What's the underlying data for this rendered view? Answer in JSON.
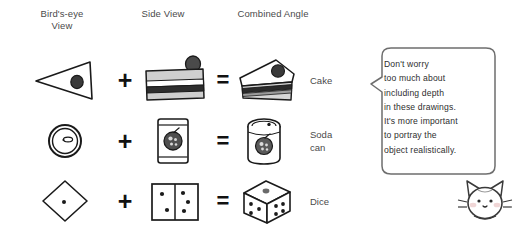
{
  "headers": {
    "birdseye": "Bird's-eye\nView",
    "side": "Side View",
    "combined": "Combined Angle"
  },
  "operators": {
    "plus": "+",
    "equals": "="
  },
  "rows": [
    {
      "id": "cake",
      "label": "Cake",
      "birdseye_icon": "cake-triangle-topview-icon",
      "side_icon": "cake-slab-sideview-icon",
      "combined_icon": "cake-wedge-3d-icon"
    },
    {
      "id": "soda",
      "label": "Soda\ncan",
      "birdseye_icon": "can-lid-topview-icon",
      "side_icon": "can-sideview-icon",
      "combined_icon": "can-3d-icon"
    },
    {
      "id": "dice",
      "label": "Dice",
      "birdseye_icon": "die-diamond-topview-icon",
      "side_icon": "die-two-faces-sideview-icon",
      "combined_icon": "die-cube-3d-icon"
    }
  ],
  "speech_bubble": {
    "text": "Don't worry\ntoo much about\nincluding depth\nin these drawings.\nIt's more important\nto portray the\nobject realistically.",
    "tail_direction": "left"
  },
  "mascot": {
    "icon": "cat-face-icon"
  },
  "colors": {
    "background": "#ffffff",
    "text": "#3b3b3b",
    "ink": "#1a1a1a",
    "operator": "#111111",
    "bubble_border": "#6e6e6e",
    "shade_light": "#d8d8d8",
    "shade_mid": "#b4b4b4",
    "shade_dark": "#3a3a3a",
    "blush": "#f0d6d6"
  }
}
